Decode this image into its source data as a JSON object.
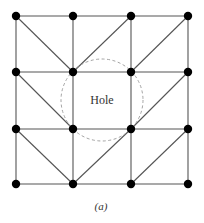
{
  "diagram": {
    "type": "triangulated-mesh",
    "grid": {
      "cols": 4,
      "rows": 4,
      "x": [
        16,
        73,
        131,
        188
      ],
      "y": [
        16,
        72,
        129,
        184
      ]
    },
    "edges_extra_diagonals": [
      [
        [
          0,
          0
        ],
        [
          1,
          1
        ]
      ],
      [
        [
          1,
          1
        ],
        [
          2,
          0
        ]
      ],
      [
        [
          2,
          1
        ],
        [
          3,
          0
        ]
      ],
      [
        [
          0,
          1
        ],
        [
          1,
          2
        ]
      ],
      [
        [
          2,
          2
        ],
        [
          3,
          1
        ]
      ],
      [
        [
          0,
          2
        ],
        [
          1,
          3
        ]
      ],
      [
        [
          1,
          3
        ],
        [
          2,
          2
        ]
      ],
      [
        [
          2,
          3
        ],
        [
          3,
          2
        ]
      ]
    ],
    "hole": {
      "label": "Hole",
      "cx": 102,
      "cy": 100,
      "r": 41
    },
    "caption": "(a)"
  }
}
